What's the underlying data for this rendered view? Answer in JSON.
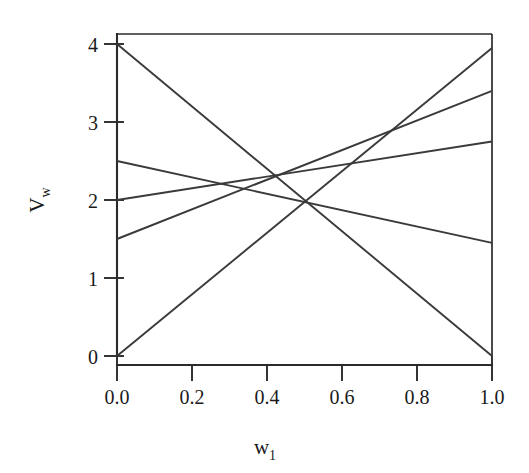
{
  "chart_data": {
    "type": "line",
    "title": "",
    "subtitle": "",
    "xlabel": "w",
    "xlabel_sub": "1",
    "ylabel": "V",
    "ylabel_sub": "w",
    "xlim": [
      0.0,
      1.0
    ],
    "ylim": [
      0.0,
      4.2
    ],
    "xticks": [
      0.0,
      0.2,
      0.4,
      0.6,
      0.8,
      1.0
    ],
    "xtick_labels": [
      "0.0",
      "0.2",
      "0.4",
      "0.6",
      "0.8",
      "1.0"
    ],
    "yticks": [
      0,
      1,
      2,
      3,
      4
    ],
    "ytick_labels": [
      "0",
      "1",
      "2",
      "3",
      "4"
    ],
    "grid": false,
    "legend": null,
    "legend_position": "none",
    "frame": "box",
    "line_color": "#3a3a3a",
    "axis_color": "#2b2b2b",
    "background": "#ffffff",
    "x": [
      0.0,
      1.0
    ],
    "series": [
      {
        "name": "line-1",
        "values": [
          4.0,
          0.0
        ],
        "intercept": 4.0,
        "slope": -4.0
      },
      {
        "name": "line-2",
        "values": [
          2.5,
          1.45
        ],
        "intercept": 2.5,
        "slope": -1.05
      },
      {
        "name": "line-3",
        "values": [
          2.0,
          2.75
        ],
        "intercept": 2.0,
        "slope": 0.75
      },
      {
        "name": "line-4",
        "values": [
          1.5,
          3.4
        ],
        "intercept": 1.5,
        "slope": 1.9
      },
      {
        "name": "line-5",
        "values": [
          0.0,
          3.95
        ],
        "intercept": 0.0,
        "slope": 3.95
      }
    ],
    "common_intersection": [
      0.5,
      2.0
    ],
    "annotations": []
  },
  "figure": {
    "caption": "",
    "width_px": 529,
    "height_px": 473
  }
}
